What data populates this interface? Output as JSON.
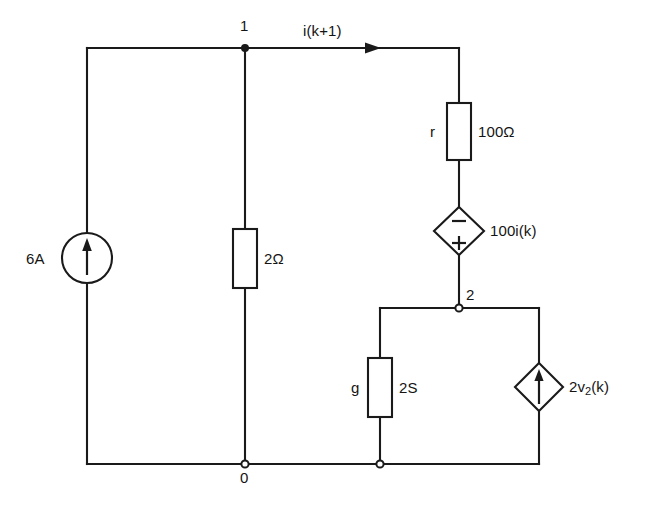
{
  "diagram": {
    "type": "electrical-circuit-schematic",
    "line_color": "#1a1a1a",
    "background_color": "#ffffff",
    "nodes": [
      {
        "id": "node-1",
        "label": "1",
        "marker": "solid-dot"
      },
      {
        "id": "node-2",
        "label": "2",
        "marker": "open-circle"
      },
      {
        "id": "node-0",
        "label": "0",
        "marker": "open-circle"
      }
    ],
    "components": [
      {
        "id": "current-source-6a",
        "kind": "independent-current-source",
        "symbol": "circle-with-up-arrow",
        "label": "6A",
        "label_side": "left"
      },
      {
        "id": "resistor-2ohm",
        "kind": "resistor",
        "symbol": "rectangle",
        "designator": "",
        "value": "2Ω",
        "value_side": "right"
      },
      {
        "id": "resistor-r-100ohm",
        "kind": "resistor",
        "symbol": "rectangle",
        "designator": "r",
        "designator_side": "left",
        "value": "100Ω",
        "value_side": "right"
      },
      {
        "id": "vcvs-100ik",
        "kind": "dependent-voltage-source",
        "symbol": "diamond-with-polarity",
        "polarity_top": "−",
        "polarity_bottom": "+",
        "value": "100i(k)",
        "value_side": "right"
      },
      {
        "id": "conductance-g-2s",
        "kind": "conductance",
        "symbol": "rectangle",
        "designator": "g",
        "designator_side": "left",
        "value": "2S",
        "value_side": "right"
      },
      {
        "id": "ccs-2v2k",
        "kind": "dependent-current-source",
        "symbol": "diamond-with-up-arrow",
        "value_prefix": "2v",
        "value_subscript": "2",
        "value_suffix": "(k)",
        "value": "2v2(k)",
        "value_side": "right"
      }
    ],
    "annotations": [
      {
        "id": "branch-current",
        "text": "i(k+1)",
        "arrow": "right",
        "location": "top-branch-between-node-1-and-resistor-r"
      }
    ]
  }
}
